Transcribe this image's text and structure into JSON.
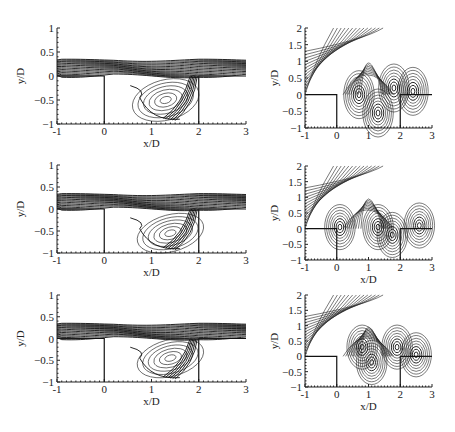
{
  "figure": {
    "panels": [
      {
        "id": "top-left",
        "xlabel": "x/D",
        "ylabel": "y/D",
        "xticks": [
          "-1",
          "0",
          "1",
          "2",
          "3"
        ],
        "yticks": [
          "1",
          "0.5",
          "0",
          "-0.5",
          "-1"
        ]
      },
      {
        "id": "top-right",
        "xlabel": "",
        "ylabel": "y/D",
        "xticks": [
          "-1",
          "0",
          "1",
          "2",
          "3"
        ],
        "yticks": [
          "2",
          "1.5",
          "1",
          "0.5",
          "0",
          "-0.5",
          "-1"
        ]
      },
      {
        "id": "middle-left",
        "xlabel": "x/D",
        "ylabel": "y/D",
        "xticks": [
          "-1",
          "0",
          "1",
          "2",
          "3"
        ],
        "yticks": [
          "1",
          "0.5",
          "0",
          "-0.5",
          "-1"
        ]
      },
      {
        "id": "middle-right",
        "xlabel": "x/D",
        "ylabel": "y/D",
        "xticks": [
          "-1",
          "0",
          "1",
          "2",
          "3"
        ],
        "yticks": [
          "2",
          "1.5",
          "1",
          "0.5",
          "0",
          "-0.5",
          "-1"
        ]
      },
      {
        "id": "bottom-left",
        "xlabel": "x/D",
        "ylabel": "y/D",
        "xticks": [
          "-1",
          "0",
          "1",
          "2",
          "3"
        ],
        "yticks": [
          "1",
          "0.5",
          "0",
          "-0.5",
          "-1"
        ]
      },
      {
        "id": "bottom-right",
        "xlabel": "x/D",
        "ylabel": "y/D",
        "xticks": [
          "-1",
          "0",
          "1",
          "2",
          "3"
        ],
        "yticks": [
          "2",
          "1.5",
          "1",
          "0.5",
          "0",
          "-0.5",
          "-1"
        ]
      }
    ]
  },
  "chart_data": [
    {
      "type": "heatmap",
      "title": "",
      "subtype": "contour",
      "xlabel": "x/D",
      "ylabel": "y/D",
      "xlim": [
        -1,
        3
      ],
      "ylim": [
        -1,
        1
      ],
      "xticks": [
        -1,
        0,
        1,
        2,
        3
      ],
      "yticks": [
        -1,
        -0.5,
        0,
        0.5,
        1
      ],
      "cavity": {
        "x": [
          0,
          2
        ],
        "y": [
          -1,
          0
        ]
      },
      "features": "shear layer band 0 < y/D < 0.35 across domain; recirculating vortex in cavity centered near x/D=1.3, y/D=-0.5"
    },
    {
      "type": "heatmap",
      "title": "",
      "subtype": "contour",
      "xlabel": "x/D",
      "ylabel": "y/D",
      "xlim": [
        -1,
        3
      ],
      "ylim": [
        -1,
        2
      ],
      "xticks": [
        -1,
        0,
        1,
        2,
        3
      ],
      "yticks": [
        -1,
        -0.5,
        0,
        0.5,
        1,
        1.5,
        2
      ],
      "cavity": {
        "x": [
          0,
          2
        ],
        "y": [
          -1,
          0
        ]
      },
      "features": "radiating acoustic contours; dense clusters near x/D=0.7 and x/D=1.8-2.2 at y/D=0; closed loops near (1.3,-0.55)"
    },
    {
      "type": "heatmap",
      "title": "",
      "subtype": "contour",
      "xlabel": "x/D",
      "ylabel": "y/D",
      "xlim": [
        -1,
        3
      ],
      "ylim": [
        -1,
        1
      ],
      "xticks": [
        -1,
        0,
        1,
        2,
        3
      ],
      "yticks": [
        -1,
        -0.5,
        0,
        0.5,
        1
      ],
      "cavity": {
        "x": [
          0,
          2
        ],
        "y": [
          -1,
          0
        ]
      },
      "features": "shear layer band; vortex centered near x/D=1.4, y/D=-0.55"
    },
    {
      "type": "heatmap",
      "title": "",
      "subtype": "contour",
      "xlabel": "x/D",
      "ylabel": "y/D",
      "xlim": [
        -1,
        3
      ],
      "ylim": [
        -1,
        2
      ],
      "xticks": [
        -1,
        0,
        1,
        2,
        3
      ],
      "yticks": [
        -1,
        -0.5,
        0,
        0.5,
        1,
        1.5,
        2
      ],
      "cavity": {
        "x": [
          0,
          2
        ],
        "y": [
          -1,
          0
        ]
      },
      "features": "lobes centered near x/D=0.1 and x/D=1.3 at y/D=0; dense cluster near x/D=1.7 spanning y/D -1 to 0.5"
    },
    {
      "type": "heatmap",
      "title": "",
      "subtype": "contour",
      "xlabel": "x/D",
      "ylabel": "y/D",
      "xlim": [
        -1,
        3
      ],
      "ylim": [
        -1,
        1
      ],
      "xticks": [
        -1,
        0,
        1,
        2,
        3
      ],
      "yticks": [
        -1,
        -0.5,
        0,
        0.5,
        1
      ],
      "cavity": {
        "x": [
          0,
          2
        ],
        "y": [
          -1,
          0
        ]
      },
      "features": "shear layer band; vortex centered near x/D=1.4, y/D=-0.45"
    },
    {
      "type": "heatmap",
      "title": "",
      "subtype": "contour",
      "xlabel": "x/D",
      "ylabel": "y/D",
      "xlim": [
        -1,
        3
      ],
      "ylim": [
        -1,
        2
      ],
      "xticks": [
        -1,
        0,
        1,
        2,
        3
      ],
      "yticks": [
        -1,
        -0.5,
        0,
        0.5,
        1,
        1.5,
        2
      ],
      "cavity": {
        "x": [
          0,
          2
        ],
        "y": [
          -1,
          0
        ]
      },
      "features": "dense clusters near (1.1,-0.2) and (1.9,0.3); closed loop near (-0.6,1.8)"
    }
  ]
}
